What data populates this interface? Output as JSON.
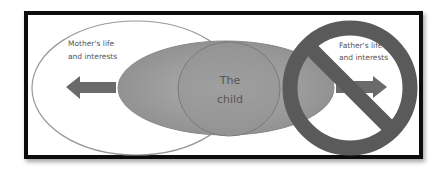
{
  "diagram": {
    "mother_label_line1": "Mother's life",
    "mother_label_line2": "and interests",
    "father_label_line1": "Father's life",
    "father_label_line2": "and interests",
    "child_label_line1": "The",
    "child_label_line2": "child",
    "colors": {
      "frame": "#111111",
      "ellipse_fill": "#9a9a9a",
      "arrow": "#6a6a6a",
      "prohibit": "#5a5a5a"
    }
  }
}
